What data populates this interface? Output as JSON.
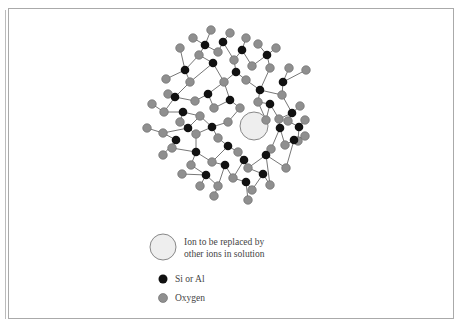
{
  "legend": {
    "ion_label_line1": "Ion to be replaced by",
    "ion_label_line2": "other ions in solution",
    "si_label": "Si or Al",
    "oxygen_label": "Oxygen"
  },
  "colors": {
    "si": "#111111",
    "oxygen": "#8f8f8f",
    "oxygen_stroke": "#666666",
    "ion_fill": "#eeeeee",
    "ion_stroke": "#888888",
    "bond": "#777777"
  },
  "molecule": {
    "ion": {
      "x": 254,
      "y": 126,
      "r": 14
    },
    "si": [
      [
        205,
        45
      ],
      [
        223,
        42
      ],
      [
        242,
        50
      ],
      [
        267,
        55
      ],
      [
        185,
        70
      ],
      [
        213,
        63
      ],
      [
        236,
        72
      ],
      [
        175,
        97
      ],
      [
        183,
        112
      ],
      [
        208,
        94
      ],
      [
        230,
        100
      ],
      [
        260,
        90
      ],
      [
        283,
        82
      ],
      [
        292,
        113
      ],
      [
        270,
        104
      ],
      [
        188,
        128
      ],
      [
        212,
        127
      ],
      [
        176,
        140
      ],
      [
        196,
        152
      ],
      [
        228,
        146
      ],
      [
        244,
        160
      ],
      [
        266,
        155
      ],
      [
        280,
        128
      ],
      [
        299,
        127
      ],
      [
        294,
        140
      ],
      [
        206,
        175
      ],
      [
        225,
        165
      ],
      [
        246,
        182
      ],
      [
        263,
        174
      ]
    ],
    "oxygen": [
      [
        193,
        38
      ],
      [
        211,
        30
      ],
      [
        230,
        33
      ],
      [
        246,
        38
      ],
      [
        258,
        44
      ],
      [
        276,
        48
      ],
      [
        199,
        55
      ],
      [
        218,
        52
      ],
      [
        234,
        60
      ],
      [
        252,
        66
      ],
      [
        180,
        48
      ],
      [
        166,
        79
      ],
      [
        190,
        82
      ],
      [
        224,
        82
      ],
      [
        246,
        80
      ],
      [
        270,
        68
      ],
      [
        289,
        68
      ],
      [
        168,
        94
      ],
      [
        164,
        112
      ],
      [
        195,
        101
      ],
      [
        214,
        108
      ],
      [
        240,
        108
      ],
      [
        258,
        102
      ],
      [
        282,
        95
      ],
      [
        306,
        70
      ],
      [
        300,
        106
      ],
      [
        152,
        104
      ],
      [
        147,
        128
      ],
      [
        163,
        133
      ],
      [
        180,
        122
      ],
      [
        200,
        116
      ],
      [
        196,
        134
      ],
      [
        218,
        138
      ],
      [
        228,
        122
      ],
      [
        266,
        120
      ],
      [
        279,
        119
      ],
      [
        288,
        121
      ],
      [
        305,
        120
      ],
      [
        163,
        155
      ],
      [
        172,
        148
      ],
      [
        191,
        165
      ],
      [
        212,
        162
      ],
      [
        238,
        152
      ],
      [
        248,
        168
      ],
      [
        271,
        149
      ],
      [
        285,
        145
      ],
      [
        298,
        141
      ],
      [
        182,
        174
      ],
      [
        200,
        186
      ],
      [
        218,
        186
      ],
      [
        233,
        178
      ],
      [
        252,
        190
      ],
      [
        270,
        185
      ],
      [
        286,
        168
      ],
      [
        305,
        136
      ],
      [
        248,
        200
      ],
      [
        214,
        196
      ]
    ],
    "bonds": [
      [
        205,
        45,
        193,
        38
      ],
      [
        205,
        45,
        211,
        30
      ],
      [
        205,
        45,
        199,
        55
      ],
      [
        205,
        45,
        218,
        52
      ],
      [
        223,
        42,
        230,
        33
      ],
      [
        223,
        42,
        218,
        52
      ],
      [
        223,
        42,
        234,
        60
      ],
      [
        242,
        50,
        246,
        38
      ],
      [
        242,
        50,
        234,
        60
      ],
      [
        242,
        50,
        252,
        66
      ],
      [
        267,
        55,
        258,
        44
      ],
      [
        267,
        55,
        276,
        48
      ],
      [
        267,
        55,
        270,
        68
      ],
      [
        267,
        55,
        252,
        66
      ],
      [
        185,
        70,
        180,
        48
      ],
      [
        185,
        70,
        166,
        79
      ],
      [
        185,
        70,
        190,
        82
      ],
      [
        185,
        70,
        199,
        55
      ],
      [
        213,
        63,
        199,
        55
      ],
      [
        213,
        63,
        224,
        82
      ],
      [
        213,
        63,
        190,
        82
      ],
      [
        236,
        72,
        234,
        60
      ],
      [
        236,
        72,
        246,
        80
      ],
      [
        236,
        72,
        224,
        82
      ],
      [
        175,
        97,
        168,
        94
      ],
      [
        175,
        97,
        190,
        82
      ],
      [
        175,
        97,
        164,
        112
      ],
      [
        175,
        97,
        195,
        101
      ],
      [
        183,
        112,
        164,
        112
      ],
      [
        183,
        112,
        180,
        122
      ],
      [
        183,
        112,
        200,
        116
      ],
      [
        208,
        94,
        195,
        101
      ],
      [
        208,
        94,
        224,
        82
      ],
      [
        208,
        94,
        214,
        108
      ],
      [
        230,
        100,
        224,
        82
      ],
      [
        230,
        100,
        214,
        108
      ],
      [
        230,
        100,
        240,
        108
      ],
      [
        260,
        90,
        246,
        80
      ],
      [
        260,
        90,
        258,
        102
      ],
      [
        260,
        90,
        270,
        68
      ],
      [
        260,
        90,
        282,
        95
      ],
      [
        283,
        82,
        289,
        68
      ],
      [
        283,
        82,
        306,
        70
      ],
      [
        283,
        82,
        282,
        95
      ],
      [
        292,
        113,
        282,
        95
      ],
      [
        292,
        113,
        300,
        106
      ],
      [
        292,
        113,
        288,
        121
      ],
      [
        292,
        113,
        279,
        119
      ],
      [
        270,
        104,
        258,
        102
      ],
      [
        270,
        104,
        266,
        120
      ],
      [
        270,
        104,
        279,
        119
      ],
      [
        188,
        128,
        180,
        122
      ],
      [
        188,
        128,
        163,
        133
      ],
      [
        188,
        128,
        196,
        134
      ],
      [
        188,
        128,
        200,
        116
      ],
      [
        212,
        127,
        200,
        116
      ],
      [
        212,
        127,
        218,
        138
      ],
      [
        212,
        127,
        228,
        122
      ],
      [
        212,
        127,
        196,
        134
      ],
      [
        176,
        140,
        163,
        133
      ],
      [
        176,
        140,
        163,
        155
      ],
      [
        176,
        140,
        172,
        148
      ],
      [
        196,
        152,
        196,
        134
      ],
      [
        196,
        152,
        191,
        165
      ],
      [
        196,
        152,
        212,
        162
      ],
      [
        196,
        152,
        172,
        148
      ],
      [
        228,
        146,
        218,
        138
      ],
      [
        228,
        146,
        238,
        152
      ],
      [
        228,
        146,
        212,
        162
      ],
      [
        244,
        160,
        238,
        152
      ],
      [
        244,
        160,
        248,
        168
      ],
      [
        244,
        160,
        233,
        178
      ],
      [
        266,
        155,
        271,
        149
      ],
      [
        266,
        155,
        248,
        168
      ],
      [
        266,
        155,
        270,
        185
      ],
      [
        266,
        155,
        286,
        168
      ],
      [
        280,
        128,
        279,
        119
      ],
      [
        280,
        128,
        271,
        149
      ],
      [
        280,
        128,
        285,
        145
      ],
      [
        299,
        127,
        305,
        120
      ],
      [
        299,
        127,
        298,
        141
      ],
      [
        299,
        127,
        288,
        121
      ],
      [
        294,
        140,
        305,
        136
      ],
      [
        294,
        140,
        285,
        145
      ],
      [
        294,
        140,
        286,
        168
      ],
      [
        206,
        175,
        191,
        165
      ],
      [
        206,
        175,
        182,
        174
      ],
      [
        206,
        175,
        200,
        186
      ],
      [
        206,
        175,
        218,
        186
      ],
      [
        225,
        165,
        212,
        162
      ],
      [
        225,
        165,
        233,
        178
      ],
      [
        225,
        165,
        218,
        186
      ],
      [
        246,
        182,
        233,
        178
      ],
      [
        246,
        182,
        252,
        190
      ],
      [
        246,
        182,
        248,
        200
      ],
      [
        263,
        174,
        248,
        168
      ],
      [
        263,
        174,
        270,
        185
      ],
      [
        263,
        174,
        252,
        190
      ],
      [
        218,
        186,
        214,
        196
      ],
      [
        152,
        104,
        164,
        112
      ],
      [
        147,
        128,
        163,
        133
      ],
      [
        228,
        122,
        240,
        108
      ],
      [
        266,
        120,
        258,
        102
      ]
    ]
  }
}
